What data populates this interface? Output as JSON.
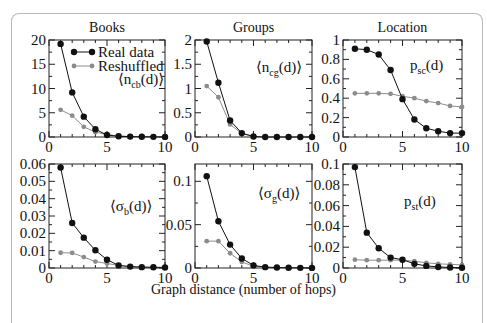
{
  "figure": {
    "xlabel": "Graph distance (number of hops)",
    "column_titles": [
      "Books",
      "Groups",
      "Location"
    ],
    "legend": {
      "real": "Real data",
      "reshuffled": "Reshuffled"
    },
    "colors": {
      "real": "#111111",
      "reshuffled": "#8c8c8c",
      "axis": "#222222",
      "frame": "#b8b8b8"
    }
  },
  "chart_data": [
    {
      "type": "line",
      "title": "Books",
      "annotation": "⟨n_cb(d)⟩",
      "ann_main": "⟨n",
      "ann_sub": "cb",
      "ann_tail": "(d)⟩",
      "x": [
        1,
        2,
        3,
        4,
        5,
        6,
        7,
        8,
        9,
        10
      ],
      "xlim": [
        0,
        10
      ],
      "ylim": [
        0,
        20
      ],
      "yticks": [
        0,
        5,
        10,
        15,
        20
      ],
      "ytick_labels": [
        "0",
        "5",
        "10",
        "15",
        "20"
      ],
      "series": [
        {
          "name": "Real data",
          "values": [
            19.2,
            9.2,
            4.2,
            1.6,
            0.4,
            0.15,
            0.08,
            0.05,
            0.03,
            0.02
          ]
        },
        {
          "name": "Reshuffled",
          "values": [
            5.6,
            4.4,
            2.1,
            1.0,
            0.5,
            0.2,
            0.1,
            0.05,
            0.03,
            0.02
          ]
        }
      ],
      "legend_position": "upper right"
    },
    {
      "type": "line",
      "title": "Groups",
      "annotation": "⟨n_cg(d)⟩",
      "ann_main": "⟨n",
      "ann_sub": "cg",
      "ann_tail": "(d)⟩",
      "x": [
        1,
        2,
        3,
        4,
        5,
        6,
        7,
        8,
        9,
        10
      ],
      "xlim": [
        0,
        10
      ],
      "ylim": [
        0,
        2
      ],
      "yticks": [
        0,
        0.5,
        1,
        1.5,
        2
      ],
      "ytick_labels": [
        "0",
        "0.5",
        "1",
        "1.5",
        "2"
      ],
      "series": [
        {
          "name": "Real data",
          "values": [
            1.97,
            1.12,
            0.34,
            0.08,
            0.01,
            0.0,
            0.0,
            0.0,
            0.0,
            0.0
          ]
        },
        {
          "name": "Reshuffled",
          "values": [
            1.05,
            0.82,
            0.26,
            0.07,
            0.01,
            0.0,
            0.0,
            0.0,
            0.0,
            0.0
          ]
        }
      ]
    },
    {
      "type": "line",
      "title": "Location",
      "annotation": "p_sc(d)",
      "ann_main": "p",
      "ann_sub": "sc",
      "ann_tail": "(d)",
      "x": [
        1,
        2,
        3,
        4,
        5,
        6,
        7,
        8,
        9,
        10
      ],
      "xlim": [
        0,
        10
      ],
      "ylim": [
        0,
        1
      ],
      "yticks": [
        0,
        0.2,
        0.4,
        0.6,
        0.8,
        1
      ],
      "ytick_labels": [
        "0",
        "0.2",
        "0.4",
        "0.6",
        "0.8",
        "1"
      ],
      "series": [
        {
          "name": "Real data",
          "values": [
            0.91,
            0.9,
            0.85,
            0.69,
            0.39,
            0.18,
            0.09,
            0.06,
            0.04,
            0.04
          ]
        },
        {
          "name": "Reshuffled",
          "values": [
            0.45,
            0.45,
            0.45,
            0.445,
            0.42,
            0.4,
            0.37,
            0.35,
            0.32,
            0.31
          ]
        }
      ]
    },
    {
      "type": "line",
      "title": "",
      "annotation": "⟨σ_b(d)⟩",
      "ann_main": "⟨σ",
      "ann_sub": "b",
      "ann_tail": "(d)⟩",
      "x": [
        1,
        2,
        3,
        4,
        5,
        6,
        7,
        8,
        9,
        10
      ],
      "xlim": [
        0,
        10
      ],
      "ylim": [
        0,
        0.06
      ],
      "yticks": [
        0,
        0.01,
        0.02,
        0.03,
        0.04,
        0.05,
        0.06
      ],
      "ytick_labels": [
        "0",
        "0.01",
        "0.02",
        "0.03",
        "0.04",
        "0.05",
        "0.06"
      ],
      "series": [
        {
          "name": "Real data",
          "values": [
            0.058,
            0.026,
            0.0175,
            0.0102,
            0.0048,
            0.0015,
            0.0008,
            0.0005,
            0.0004,
            0.0003
          ]
        },
        {
          "name": "Reshuffled",
          "values": [
            0.0088,
            0.0087,
            0.0063,
            0.0037,
            0.0026,
            0.0015,
            0.0008,
            0.0005,
            0.0004,
            0.0003
          ]
        }
      ]
    },
    {
      "type": "line",
      "title": "",
      "annotation": "⟨σ_g(d)⟩",
      "ann_main": "⟨σ",
      "ann_sub": "g",
      "ann_tail": "(d)⟩",
      "x": [
        1,
        2,
        3,
        4,
        5,
        6,
        7,
        8,
        9,
        10
      ],
      "xlim": [
        0,
        10
      ],
      "ylim": [
        0,
        0.12
      ],
      "yticks": [
        0,
        0.05,
        0.1
      ],
      "ytick_labels": [
        "0",
        "0.05",
        "0.1"
      ],
      "series": [
        {
          "name": "Real data",
          "values": [
            0.106,
            0.054,
            0.027,
            0.011,
            0.003,
            0.001,
            0.0005,
            0.0003,
            0.0002,
            0.0001
          ]
        },
        {
          "name": "Reshuffled",
          "values": [
            0.031,
            0.031,
            0.017,
            0.007,
            0.002,
            0.001,
            0.0005,
            0.0003,
            0.0002,
            0.0001
          ]
        }
      ]
    },
    {
      "type": "line",
      "title": "",
      "annotation": "p_st(d)",
      "ann_main": "p",
      "ann_sub": "st",
      "ann_tail": "(d)",
      "x": [
        1,
        2,
        3,
        4,
        5,
        6,
        7,
        8,
        9,
        10
      ],
      "xlim": [
        0,
        10
      ],
      "ylim": [
        0,
        0.1
      ],
      "yticks": [
        0,
        0.02,
        0.04,
        0.06,
        0.08,
        0.1
      ],
      "ytick_labels": [
        "0",
        "0.02",
        "0.04",
        "0.06",
        "0.08",
        "0.1"
      ],
      "series": [
        {
          "name": "Real data",
          "values": [
            0.097,
            0.034,
            0.019,
            0.01,
            0.008,
            0.004,
            0.002,
            0.001,
            0.0005,
            0.0003
          ]
        },
        {
          "name": "Reshuffled",
          "values": [
            0.008,
            0.0075,
            0.0075,
            0.0075,
            0.0075,
            0.0065,
            0.005,
            0.004,
            0.0035,
            0.003
          ]
        }
      ]
    }
  ],
  "layout": {
    "panels": [
      {
        "x0": 49,
        "x1": 165,
        "y0": 40,
        "y1": 137
      },
      {
        "x0": 195,
        "x1": 312,
        "y0": 40,
        "y1": 137
      },
      {
        "x0": 343,
        "x1": 462,
        "y0": 40,
        "y1": 137
      },
      {
        "x0": 49,
        "x1": 165,
        "y0": 164,
        "y1": 268
      },
      {
        "x0": 195,
        "x1": 312,
        "y0": 164,
        "y1": 268
      },
      {
        "x0": 343,
        "x1": 462,
        "y0": 164,
        "y1": 268
      }
    ],
    "annotation_pos": [
      {
        "x": 118,
        "y": 84
      },
      {
        "x": 256,
        "y": 72
      },
      {
        "x": 410,
        "y": 70
      },
      {
        "x": 110,
        "y": 211
      },
      {
        "x": 258,
        "y": 198
      },
      {
        "x": 404,
        "y": 206
      }
    ]
  }
}
